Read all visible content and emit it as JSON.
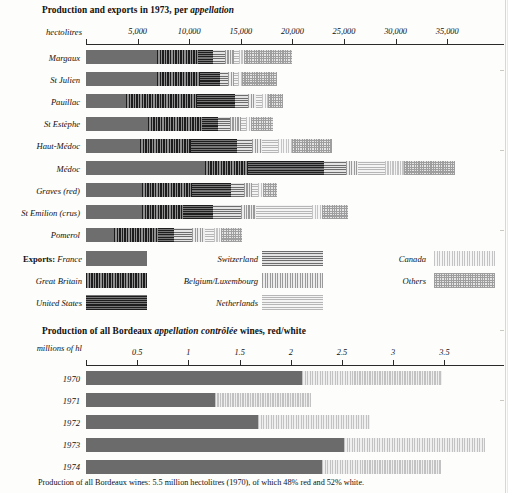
{
  "top": {
    "title_plain": "Production and exports in 1973, per ",
    "title_italic": "appellation",
    "axis_name": "hectolitres",
    "axis_ticks": [
      "5,000",
      "10,000",
      "15,000",
      "20,000",
      "25,000",
      "30,000",
      "35,000"
    ]
  },
  "bottom": {
    "title_a": "Production of all Bordeaux ",
    "title_b": "appellation contrôlée",
    "title_c": " wines, red/white",
    "axis_name": "millions of hl",
    "axis_ticks": [
      "0.5",
      "1",
      "1.5",
      "2",
      "2.5",
      "3",
      "3.5"
    ]
  },
  "legend": {
    "exports_lead": "Exports:",
    "items": [
      {
        "label": "France",
        "key": "p-france"
      },
      {
        "label": "Great Britain",
        "key": "p-gb"
      },
      {
        "label": "United States",
        "key": "p-us"
      },
      {
        "label": "Switzerland",
        "key": "p-swiss"
      },
      {
        "label": "Belgium/Luxembourg",
        "key": "p-belg"
      },
      {
        "label": "Netherlands",
        "key": "p-neth"
      },
      {
        "label": "Canada",
        "key": "p-canada"
      },
      {
        "label": "Others",
        "key": "p-others"
      }
    ]
  },
  "footnote": "Production of all Bordeaux wines: 5.5 million hectolitres (1970), of which 48% red and 52% white.",
  "chart_data": [
    {
      "type": "bar",
      "orientation": "horizontal",
      "stacked": true,
      "title": "Production and exports in 1973, per appellation",
      "xlabel": "hectolitres",
      "xlim": [
        0,
        38000
      ],
      "xticks": [
        5000,
        10000,
        15000,
        20000,
        25000,
        30000,
        35000
      ],
      "grid": false,
      "legend_position": "below-plot",
      "series": [
        {
          "name": "France",
          "values": [
            6900,
            6900,
            3900,
            6000,
            5200,
            11500,
            5400,
            5400,
            2700
          ]
        },
        {
          "name": "Great Britain",
          "values": [
            4000,
            4100,
            6900,
            5200,
            5000,
            4200,
            4900,
            4000,
            4300
          ]
        },
        {
          "name": "United States",
          "values": [
            1400,
            2000,
            3600,
            1600,
            4400,
            7400,
            3800,
            2900,
            1500
          ]
        },
        {
          "name": "Switzerland",
          "values": [
            1200,
            800,
            1300,
            1200,
            1500,
            2100,
            1200,
            2700,
            1800
          ]
        },
        {
          "name": "Belgium/Luxembourg",
          "values": [
            800,
            500,
            800,
            1000,
            1000,
            1200,
            800,
            1500,
            1200
          ]
        },
        {
          "name": "Netherlands",
          "values": [
            500,
            400,
            600,
            500,
            1500,
            2600,
            600,
            5400,
            900
          ]
        },
        {
          "name": "Canada",
          "values": [
            500,
            400,
            500,
            500,
            1400,
            1800,
            500,
            1000,
            700
          ]
        },
        {
          "name": "Others",
          "values": [
            4700,
            3400,
            1500,
            2100,
            3800,
            5000,
            1300,
            2500,
            2000
          ]
        }
      ],
      "categories": [
        "Margaux",
        "St Julien",
        "Pauillac",
        "St Estèphe",
        "Haut-Médoc",
        "Médoc",
        "Graves (red)",
        "St Emilion (crus)",
        "Pomerol"
      ]
    },
    {
      "type": "bar",
      "orientation": "horizontal",
      "stacked": true,
      "title": "Production of all Bordeaux appellation contrôlée wines, red/white",
      "xlabel": "millions of hl",
      "xlim": [
        0,
        4.1
      ],
      "xticks": [
        0.5,
        1,
        1.5,
        2,
        2.5,
        3,
        3.5
      ],
      "grid": false,
      "categories": [
        "1970",
        "1971",
        "1972",
        "1973",
        "1974"
      ],
      "series": [
        {
          "name": "red",
          "values": [
            2.11,
            1.26,
            1.68,
            2.52,
            2.3
          ]
        },
        {
          "name": "white",
          "values": [
            1.37,
            0.94,
            1.09,
            1.38,
            1.17
          ]
        }
      ]
    }
  ]
}
